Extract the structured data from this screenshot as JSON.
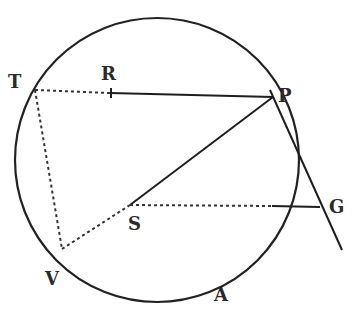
{
  "figure": {
    "type": "geometric-diagram",
    "labels": {
      "T": "T",
      "R": "R",
      "P": "P",
      "S": "S",
      "G": "G",
      "V": "V",
      "A": "A"
    },
    "points": {
      "T": [
        35,
        90
      ],
      "R": [
        110,
        92
      ],
      "P": [
        273,
        97
      ],
      "S": [
        130,
        205
      ],
      "G": [
        320,
        207
      ],
      "V": [
        60,
        248
      ],
      "circle_center": [
        157,
        160
      ],
      "tangent_end": [
        342,
        250
      ]
    },
    "circle_radius": 142,
    "segments": [
      {
        "from": "T",
        "to": "R",
        "style": "dotted"
      },
      {
        "from": "R",
        "to": "P",
        "style": "solid"
      },
      {
        "from": "T",
        "to": "V",
        "style": "dotted"
      },
      {
        "from": "V",
        "to": "S",
        "style": "dotted"
      },
      {
        "from": "S",
        "to": "P",
        "style": "solid"
      },
      {
        "from": "S",
        "to": "G",
        "style": "dotted-then-solid"
      },
      {
        "from": "P",
        "to": "tangent_end",
        "style": "solid"
      }
    ]
  }
}
